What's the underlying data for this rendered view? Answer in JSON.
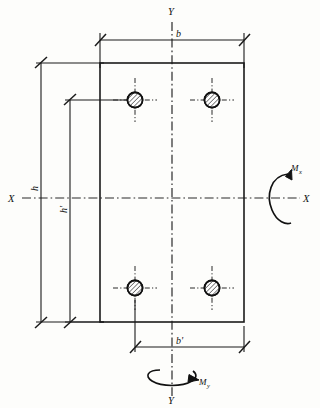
{
  "figure": {
    "type": "engineering-cross-section"
  },
  "axes": {
    "x_left_label": "X",
    "x_right_label": "X",
    "y_top_label": "Y",
    "y_bottom_label": "Y"
  },
  "dimensions": {
    "width_overall": "b",
    "width_bars": "b'",
    "depth_overall": "h",
    "depth_bars": "h'"
  },
  "moments": {
    "about_x": "M",
    "about_x_sub": "x",
    "about_y": "M",
    "about_y_sub": "y"
  },
  "rebars": [
    {
      "name": "bar-top-left",
      "x": 135,
      "y": 100
    },
    {
      "name": "bar-top-right",
      "x": 212,
      "y": 100
    },
    {
      "name": "bar-bottom-left",
      "x": 135,
      "y": 288
    },
    {
      "name": "bar-bottom-right",
      "x": 212,
      "y": 288
    }
  ],
  "colors": {
    "ink": "#1b1b1b",
    "background": "#fdfdfb",
    "centerline": "#2a2a2a"
  },
  "geometry": {
    "section_left": 100,
    "section_right": 244,
    "section_top": 63,
    "section_bottom": 322,
    "y_axis_x": 172,
    "x_axis_y": 198
  }
}
